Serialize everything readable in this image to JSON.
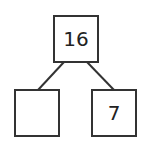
{
  "diagram": {
    "type": "number-bond",
    "whole": {
      "value": "16"
    },
    "parts": [
      {
        "value": ""
      },
      {
        "value": "7"
      }
    ],
    "colors": {
      "stroke": "#333333",
      "text": "#222222",
      "background": "#ffffff"
    }
  }
}
